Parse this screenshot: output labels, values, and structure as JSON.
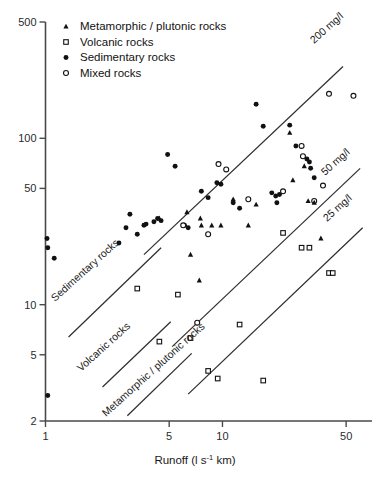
{
  "chart_data": {
    "type": "scatter",
    "title": "",
    "xlabel": "Runoff (l s-1 km)",
    "xlabel_parts": {
      "pre": "Runoff (l s",
      "sup": "-1",
      "post": " km)"
    },
    "ylabel": "",
    "xscale": "log",
    "yscale": "log",
    "xlim": [
      1,
      70
    ],
    "ylim": [
      2,
      500
    ],
    "xticks": [
      1,
      5,
      10,
      50
    ],
    "xtick_labels": [
      "1",
      "5",
      "10",
      "50"
    ],
    "yticks": [
      2,
      5,
      10,
      50,
      100,
      500
    ],
    "ytick_labels": [
      "2",
      "5",
      "10",
      "50",
      "100",
      "500"
    ],
    "grid": false,
    "legend_position": "top-left",
    "legend": [
      {
        "marker": "filled-triangle",
        "label": "Metamorphic / plutonic rocks"
      },
      {
        "marker": "open-square",
        "label": "Volcanic rocks"
      },
      {
        "marker": "filled-circle",
        "label": "Sedimentary rocks"
      },
      {
        "marker": "open-circle",
        "label": "Mixed rocks"
      }
    ],
    "annotations": [
      {
        "text": "200 mg/l",
        "kind": "iso-line-label",
        "rotation": -42
      },
      {
        "text": "50 mg/l",
        "kind": "iso-line-label",
        "rotation": -42
      },
      {
        "text": "25 mg/l",
        "kind": "iso-line-label",
        "rotation": -42
      },
      {
        "text": "Sedimentary rocks",
        "kind": "group-line-label",
        "rotation": -42
      },
      {
        "text": "Volcanic rocks",
        "kind": "group-line-label",
        "rotation": -42
      },
      {
        "text": "Metamorphic / plutonic rocks",
        "kind": "group-line-label",
        "rotation": -42
      }
    ],
    "iso_lines": [
      {
        "name": "200 mg/l",
        "concentration_mg_per_l": 200,
        "x": [
          3.6,
          48.0
        ],
        "y": [
          20.0,
          270.0
        ]
      },
      {
        "name": "50 mg/l",
        "concentration_mg_per_l": 50,
        "x": [
          5.2,
          60.0
        ],
        "y": [
          5.6,
          66.0
        ]
      },
      {
        "name": "25 mg/l",
        "concentration_mg_per_l": 25,
        "x": [
          6.4,
          62.0
        ],
        "y": [
          2.9,
          29.0
        ]
      },
      {
        "name": "Sedimentary rocks",
        "concentration_mg_per_l": 200,
        "x": [
          1.35,
          4.5
        ],
        "y": [
          6.4,
          22.0
        ]
      },
      {
        "name": "Volcanic rocks",
        "concentration_mg_per_l": 50,
        "x": [
          2.1,
          5.1
        ],
        "y": [
          3.2,
          7.9
        ]
      },
      {
        "name": "Metamorphic / plutonic rocks",
        "concentration_mg_per_l": 25,
        "x": [
          2.9,
          6.7
        ],
        "y": [
          2.15,
          5.1
        ]
      }
    ],
    "series": [
      {
        "name": "Sedimentary rocks",
        "marker": "filled-circle",
        "points": [
          [
            1.02,
            25.0
          ],
          [
            1.03,
            22.0
          ],
          [
            1.12,
            19.0
          ],
          [
            1.03,
            2.85
          ],
          [
            2.6,
            23.5
          ],
          [
            2.85,
            29.0
          ],
          [
            3.0,
            35.0
          ],
          [
            3.3,
            26.5
          ],
          [
            3.6,
            30.0
          ],
          [
            3.7,
            30.5
          ],
          [
            4.1,
            31.5
          ],
          [
            4.3,
            33.0
          ],
          [
            4.5,
            32.0
          ],
          [
            4.9,
            80.0
          ],
          [
            5.4,
            68.0
          ],
          [
            6.1,
            30.0
          ],
          [
            6.4,
            29.0
          ],
          [
            7.6,
            48.0
          ],
          [
            8.3,
            44.0
          ],
          [
            9.3,
            54.0
          ],
          [
            9.8,
            53.0
          ],
          [
            11.5,
            41.0
          ],
          [
            12.5,
            38.0
          ],
          [
            15.5,
            160.0
          ],
          [
            17.0,
            118.0
          ],
          [
            19.0,
            47.0
          ],
          [
            21.0,
            46.0
          ],
          [
            24.0,
            120.0
          ],
          [
            26.0,
            90.0
          ],
          [
            30.0,
            75.0
          ],
          [
            31.0,
            72.0
          ],
          [
            31.5,
            66.0
          ],
          [
            33.0,
            58.0
          ],
          [
            20.0,
            45.0
          ],
          [
            20.3,
            41.0
          ]
        ]
      },
      {
        "name": "Mixed rocks",
        "marker": "open-circle",
        "points": [
          [
            6.0,
            30.0
          ],
          [
            8.3,
            26.5
          ],
          [
            9.5,
            70.0
          ],
          [
            10.5,
            65.0
          ],
          [
            14.0,
            43.0
          ],
          [
            22.0,
            48.0
          ],
          [
            28.0,
            90.0
          ],
          [
            28.5,
            78.0
          ],
          [
            33.0,
            42.0
          ],
          [
            37.0,
            52.0
          ],
          [
            40.0,
            185.0
          ],
          [
            55.0,
            180.0
          ],
          [
            7.2,
            7.8
          ]
        ]
      },
      {
        "name": "Metamorphic / plutonic rocks",
        "marker": "filled-triangle",
        "points": [
          [
            4.4,
            33.0
          ],
          [
            6.3,
            36.0
          ],
          [
            7.5,
            33.0
          ],
          [
            7.6,
            30.0
          ],
          [
            6.6,
            20.0
          ],
          [
            7.4,
            14.0
          ],
          [
            8.7,
            30.0
          ],
          [
            9.8,
            30.0
          ],
          [
            11.5,
            43.0
          ],
          [
            14.0,
            30.0
          ],
          [
            15.5,
            40.0
          ],
          [
            24.0,
            108.0
          ],
          [
            25.0,
            56.0
          ],
          [
            29.0,
            68.0
          ],
          [
            30.5,
            42.0
          ],
          [
            33.0,
            41.0
          ],
          [
            36.0,
            25.0
          ]
        ]
      },
      {
        "name": "Volcanic rocks",
        "marker": "open-square",
        "points": [
          [
            3.3,
            12.5
          ],
          [
            4.4,
            6.0
          ],
          [
            5.6,
            11.5
          ],
          [
            6.6,
            6.3
          ],
          [
            8.3,
            4.0
          ],
          [
            9.4,
            3.6
          ],
          [
            12.5,
            7.6
          ],
          [
            17.0,
            3.5
          ],
          [
            22.0,
            27.0
          ],
          [
            28.0,
            22.0
          ],
          [
            31.0,
            22.0
          ],
          [
            40.0,
            15.5
          ],
          [
            42.0,
            15.5
          ]
        ]
      }
    ]
  }
}
